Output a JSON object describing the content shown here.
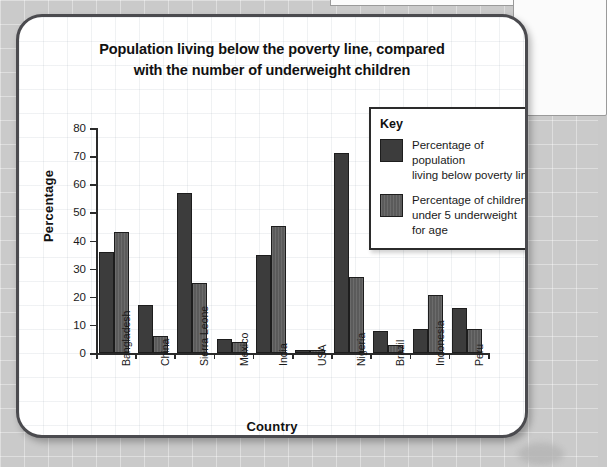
{
  "chart_data": {
    "type": "bar",
    "title": "Population living below the poverty line, compared with the number of underweight children",
    "title_line1": "Population living below the poverty line, compared",
    "title_line2": "with the number of underweight children",
    "xlabel": "Country",
    "ylabel": "Percentage",
    "ylim": [
      0,
      80
    ],
    "ytick_step": 10,
    "yticks": [
      "0",
      "10",
      "20",
      "30",
      "40",
      "50",
      "60",
      "70",
      "80"
    ],
    "grid": false,
    "legend_position": "top-right",
    "legend_title": "Key",
    "categories": [
      "Bangladesh",
      "China",
      "Sierra Leone",
      "Mexico",
      "India",
      "USA",
      "Nigeria",
      "Brazil",
      "Indonesia",
      "Peru"
    ],
    "series": [
      {
        "name": "Percentage of population living below poverty line",
        "name_line1": "Percentage of population",
        "name_line2": "living below poverty line",
        "color": "#3c3c3c",
        "values": [
          36,
          17,
          57,
          5,
          35,
          1,
          71,
          8,
          8.5,
          16
        ]
      },
      {
        "name": "Percentage of children under 5 underweight for age",
        "name_line1": "Percentage of children",
        "name_line2": "under 5 underweight",
        "name_line3": "for age",
        "color": "#5b5b5b",
        "values": [
          43,
          6,
          25,
          4,
          45,
          1,
          27,
          3,
          20.5,
          8.5
        ]
      }
    ]
  }
}
